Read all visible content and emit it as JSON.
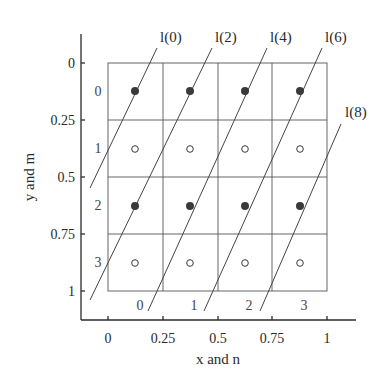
{
  "figure": {
    "x_axis": {
      "title": "x and n",
      "ticks": [
        "0",
        "0.25",
        "0.5",
        "0.75",
        "1"
      ]
    },
    "y_axis": {
      "title": "y and m",
      "ticks": [
        "0",
        "0.25",
        "0.5",
        "0.75",
        "1"
      ]
    },
    "grid": {
      "rows": 4,
      "cols": 4,
      "row_indices": [
        "0",
        "1",
        "2",
        "3"
      ],
      "col_indices": [
        "0",
        "1",
        "2",
        "3"
      ]
    },
    "dots": {
      "filled_rows": [
        0,
        2
      ],
      "open_rows": [
        1,
        3
      ]
    },
    "lines": [
      {
        "label": "l(0)"
      },
      {
        "label": "l(2)"
      },
      {
        "label": "l(4)"
      },
      {
        "label": "l(6)"
      },
      {
        "label": "l(8)"
      }
    ],
    "colors": {
      "ink": "#2a2a2a",
      "grid": "#555555",
      "dot": "#3a3a3a"
    }
  }
}
